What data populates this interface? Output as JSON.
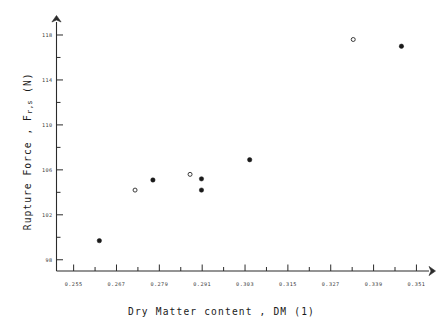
{
  "figure": {
    "background_color": "#ffffff",
    "ink_color": "#1a1a1a"
  },
  "axes": {
    "x_title_text": "Dry Matter content ,  DM   (1)",
    "y_title_main": "Rupture Force ,  F",
    "y_title_subscript": "r,s",
    "y_title_unit": "(N)",
    "x_tick_labels": [
      "0.255",
      "0.267",
      "0.279",
      "0.291",
      "0.303",
      "0.315",
      "0.327",
      "0.339",
      "0.351"
    ],
    "y_tick_labels": [
      "118",
      "114",
      "110",
      "106",
      "102",
      "98"
    ]
  },
  "chart_data": {
    "type": "scatter",
    "title": "",
    "xlabel": "Dry Matter content , DM (1)",
    "ylabel": "Rupture Force , F r,s (N)",
    "xlim": [
      0.2502,
      0.3534
    ],
    "ylim": [
      97.0,
      118.8
    ],
    "xticks": [
      0.255,
      0.267,
      0.279,
      0.291,
      0.303,
      0.315,
      0.327,
      0.339,
      0.351
    ],
    "yticks": [
      98,
      102,
      106,
      110,
      114,
      118
    ],
    "x_minor_tick_step": 0.006,
    "y_minor_tick_step": 2,
    "grid": false,
    "legend": false,
    "series": [
      {
        "name": "filled-marker",
        "marker": "filled-circle",
        "color": "#1a1a1a",
        "points": [
          {
            "x": 0.2622,
            "y": 99.7
          },
          {
            "x": 0.2772,
            "y": 105.1
          },
          {
            "x": 0.2908,
            "y": 105.2
          },
          {
            "x": 0.2908,
            "y": 104.2
          },
          {
            "x": 0.3043,
            "y": 106.9
          },
          {
            "x": 0.3468,
            "y": 117.0
          }
        ]
      },
      {
        "name": "open-marker",
        "marker": "open-circle",
        "color": "#3a3a3a",
        "points": [
          {
            "x": 0.2722,
            "y": 104.2
          },
          {
            "x": 0.2876,
            "y": 105.6
          },
          {
            "x": 0.3333,
            "y": 117.6
          }
        ]
      }
    ]
  }
}
